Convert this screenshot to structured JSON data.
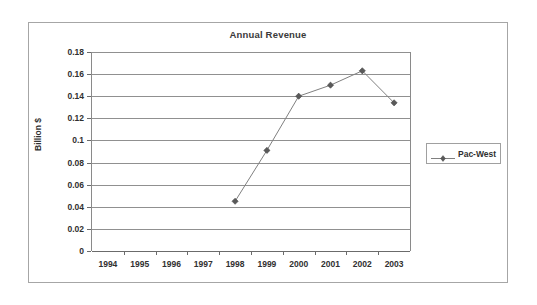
{
  "chart_data": {
    "type": "line",
    "title": "Annual Revenue",
    "xlabel": "",
    "ylabel": "Billion $",
    "categories": [
      "1994",
      "1995",
      "1996",
      "1997",
      "1998",
      "1999",
      "2000",
      "2001",
      "2002",
      "2003"
    ],
    "series": [
      {
        "name": "Pac-West",
        "values": [
          null,
          null,
          null,
          null,
          0.045,
          0.091,
          0.14,
          0.15,
          0.163,
          0.134
        ]
      }
    ],
    "ylim": [
      0,
      0.18
    ],
    "yticks": [
      "0",
      "0.02",
      "0.04",
      "0.06",
      "0.08",
      "0.1",
      "0.12",
      "0.14",
      "0.16",
      "0.18"
    ],
    "ytick_values": [
      0,
      0.02,
      0.04,
      0.06,
      0.08,
      0.1,
      0.12,
      0.14,
      0.16,
      0.18
    ],
    "grid": true,
    "legend_position": "right",
    "marker": "diamond",
    "colors": {
      "line": "#808080",
      "marker": "#595959",
      "grid": "#909090",
      "axis": "#6b6b6b",
      "text": "#303030",
      "title": "#3a3a3a",
      "border": "#a6a6a6",
      "background": "#ffffff"
    }
  },
  "legend": {
    "entries": [
      {
        "label": "Pac-West",
        "marker_icon": "diamond-marker-icon"
      }
    ]
  }
}
